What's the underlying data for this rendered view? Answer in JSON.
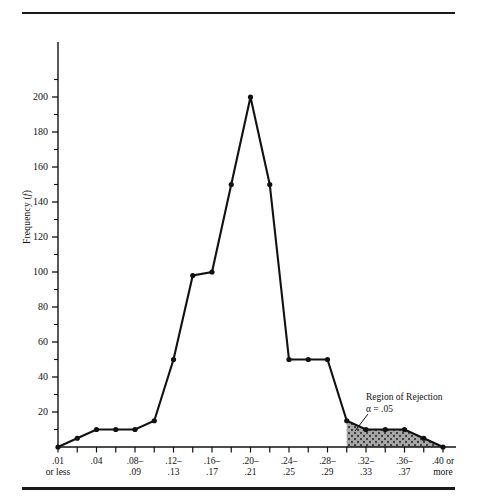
{
  "figure": {
    "y_axis_label": "Frequency (f)",
    "y_axis_label_prefix": "Frequency (",
    "y_axis_label_italic": "f",
    "y_axis_label_suffix": ")"
  },
  "annotation": {
    "line1": "Region of Rejection",
    "line2": "α = .05"
  },
  "chart_data": {
    "type": "line",
    "title": "",
    "xlabel": "",
    "ylabel": "Frequency (f)",
    "ylim": [
      0,
      210
    ],
    "yticks": [
      0,
      20,
      40,
      60,
      80,
      100,
      120,
      140,
      160,
      180,
      200
    ],
    "ytick_labels": [
      "",
      "20",
      "40",
      "60",
      "80",
      "100",
      "120",
      "140",
      "160",
      "180",
      "200"
    ],
    "yminorticks": [
      10,
      30,
      50,
      70,
      90,
      110,
      130,
      150,
      170,
      190,
      210
    ],
    "grid": false,
    "legend": false,
    "n_points": 21,
    "x_index": [
      0,
      1,
      2,
      3,
      4,
      5,
      6,
      7,
      8,
      9,
      10,
      11,
      12,
      13,
      14,
      15,
      16,
      17,
      18,
      19,
      20
    ],
    "categories": [
      ".01 or less",
      ".02-.03",
      ".04",
      ".06-.07",
      ".08-.09",
      ".10-.11",
      ".12-.13",
      ".14-.15",
      ".16-.17",
      ".18-.19",
      ".20-.21",
      ".22-.23",
      ".24-.25",
      ".26-.27",
      ".28-.29",
      ".30-.31",
      ".32-.33",
      ".34-.35",
      ".36-.37",
      ".38-.39",
      ".40 or more"
    ],
    "values": [
      0,
      5,
      10,
      10,
      10,
      15,
      50,
      98,
      100,
      150,
      200,
      150,
      50,
      50,
      50,
      15,
      10,
      10,
      10,
      5,
      0
    ],
    "tick_labels": [
      {
        "index": 0,
        "line1": ".01",
        "line2": "or less"
      },
      {
        "index": 2,
        "line1": ".04",
        "line2": ""
      },
      {
        "index": 4,
        "line1": ".08–",
        "line2": ".09"
      },
      {
        "index": 6,
        "line1": ".12–",
        "line2": ".13"
      },
      {
        "index": 8,
        "line1": ".16–",
        "line2": ".17"
      },
      {
        "index": 10,
        "line1": ".20–",
        "line2": ".21"
      },
      {
        "index": 12,
        "line1": ".24–",
        "line2": ".25"
      },
      {
        "index": 14,
        "line1": ".28–",
        "line2": ".29"
      },
      {
        "index": 16,
        "line1": ".32–",
        "line2": ".33"
      },
      {
        "index": 18,
        "line1": ".36–",
        "line2": ".37"
      },
      {
        "index": 20,
        "line1": ".40 or",
        "line2": "more"
      }
    ],
    "shaded_region": {
      "label": "Region of Rejection",
      "alpha_label": "α = .05",
      "start_index": 15,
      "end_index": 20,
      "fill": "#9a9a9a",
      "pattern": "crosshatch-dots"
    },
    "colors": {
      "line": "#111111",
      "marker": "#111111",
      "axis": "#111111",
      "background": "#ffffff"
    }
  }
}
